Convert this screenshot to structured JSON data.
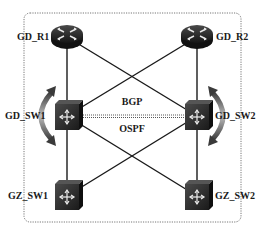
{
  "diagram": {
    "type": "network-topology",
    "nodes": [
      {
        "id": "gd_r1",
        "label": "GD_R1",
        "kind": "router",
        "x": 67,
        "y": 37
      },
      {
        "id": "gd_r2",
        "label": "GD_R2",
        "kind": "router",
        "x": 197,
        "y": 37
      },
      {
        "id": "gd_sw1",
        "label": "GD_SW1",
        "kind": "switch",
        "x": 67,
        "y": 116
      },
      {
        "id": "gd_sw2",
        "label": "GD_SW2",
        "kind": "switch",
        "x": 197,
        "y": 116
      },
      {
        "id": "gz_sw1",
        "label": "GZ_SW1",
        "kind": "switch",
        "x": 67,
        "y": 196
      },
      {
        "id": "gz_sw2",
        "label": "GZ_SW2",
        "kind": "switch",
        "x": 197,
        "y": 196
      }
    ],
    "links": [
      {
        "from": "gd_r1",
        "to": "gd_sw1"
      },
      {
        "from": "gd_r2",
        "to": "gd_sw2"
      },
      {
        "from": "gd_r1",
        "to": "gd_sw2"
      },
      {
        "from": "gd_r2",
        "to": "gd_sw1"
      },
      {
        "from": "gd_sw1",
        "to": "gz_sw1"
      },
      {
        "from": "gd_sw2",
        "to": "gz_sw2"
      },
      {
        "from": "gd_sw1",
        "to": "gz_sw2"
      },
      {
        "from": "gd_sw2",
        "to": "gz_sw1"
      },
      {
        "from": "gd_sw1",
        "to": "gd_sw2",
        "style": "dotted"
      }
    ],
    "protocols": {
      "upper": "BGP",
      "lower": "OSPF"
    },
    "colors": {
      "line": "#1a1a1a",
      "device": "#2b2b2b",
      "border": "#777777",
      "arrow": "#555555"
    }
  }
}
